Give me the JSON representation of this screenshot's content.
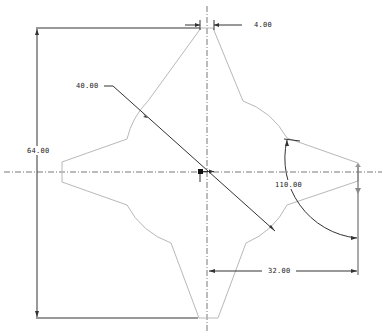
{
  "drawing": {
    "background": "#ffffff",
    "profile_color": "#b8b8b8",
    "dimension_color": "#333333",
    "centerline_color": "#555555",
    "dimensions": {
      "width_top": "4.00",
      "radius": "40.00",
      "height_total": "64.00",
      "angle": "110.00",
      "offset": "32.00"
    },
    "center": {
      "x": 207,
      "y": 172
    }
  }
}
